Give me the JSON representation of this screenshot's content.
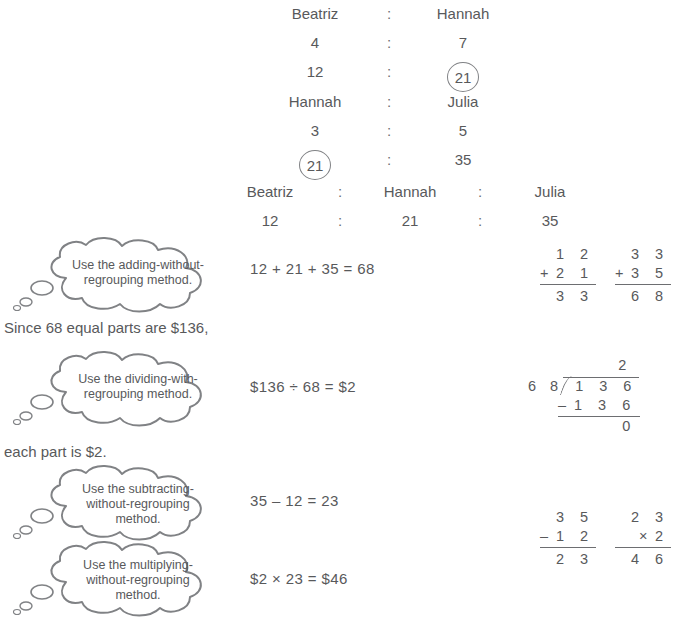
{
  "ratio_tables": [
    {
      "id": "beatriz-hannah",
      "headers": [
        "Beatriz",
        "Hannah"
      ],
      "separator": ":",
      "rows": [
        {
          "values": [
            "4",
            "7"
          ],
          "circled": [
            false,
            false
          ]
        },
        {
          "values": [
            "12",
            "21"
          ],
          "circled": [
            false,
            true
          ]
        }
      ]
    },
    {
      "id": "hannah-julia",
      "headers": [
        "Hannah",
        "Julia"
      ],
      "separator": ":",
      "rows": [
        {
          "values": [
            "3",
            "5"
          ],
          "circled": [
            false,
            false
          ]
        },
        {
          "values": [
            "21",
            "35"
          ],
          "circled": [
            true,
            false
          ]
        }
      ]
    },
    {
      "id": "combined",
      "headers": [
        "Beatriz",
        "Hannah",
        "Julia"
      ],
      "separator": ":",
      "rows": [
        {
          "values": [
            "12",
            "21",
            "35"
          ],
          "circled": [
            false,
            false,
            false
          ]
        }
      ]
    }
  ],
  "prose": {
    "since_line": "Since 68 equal parts are $136,",
    "each_part_line": "each part is $2."
  },
  "steps": [
    {
      "bubble": "Use the adding-without-regrouping method.",
      "bubble_lines": [
        "Use the adding-without-",
        "regrouping method."
      ],
      "equation": "12 + 21 + 35  =  68"
    },
    {
      "bubble": "Use the dividing-with-regrouping method.",
      "bubble_lines": [
        "Use the dividing-with-",
        "regrouping method."
      ],
      "equation": "$136 ÷ 68  =  $2"
    },
    {
      "bubble": "Use the subtracting-without-regrouping method.",
      "bubble_lines": [
        "Use the subtracting-",
        "without-regrouping",
        "method."
      ],
      "equation": "35 – 12  =  23"
    },
    {
      "bubble": "Use the multiplying-without-regrouping method.",
      "bubble_lines": [
        "Use the multiplying-",
        "without-regrouping",
        "method."
      ],
      "equation": "$2 × 23  =  $46"
    }
  ],
  "vertical_calculations": [
    {
      "id": "add-12-21",
      "operator": "+",
      "top": "1 2",
      "bottom": "2 1",
      "result": "3 3"
    },
    {
      "id": "add-33-35",
      "operator": "+",
      "top": "3 3",
      "bottom": "3 5",
      "result": "6 8"
    },
    {
      "id": "subtract-35-12",
      "operator": "–",
      "top": "3 5",
      "bottom": "1 2",
      "result": "2 3"
    },
    {
      "id": "multiply-23-2",
      "operator": "×",
      "top": "2 3",
      "bottom": "2",
      "result": "4 6"
    }
  ],
  "long_division": {
    "id": "divide-136-by-68",
    "quotient": "2",
    "divisor": "6 8",
    "dividend": "1 3 6",
    "subtract_operator": "–",
    "subtrahend": "1 3 6",
    "remainder": "0"
  },
  "colors": {
    "ink": "#58595b",
    "rule": "#6d6e71",
    "bubble_stroke": "#808285",
    "page": "#ffffff"
  }
}
